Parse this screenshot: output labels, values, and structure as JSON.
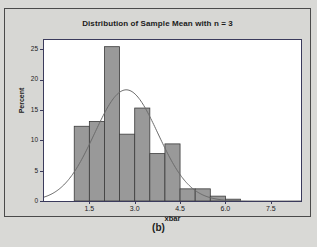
{
  "figure": {
    "caption": "(b)",
    "background_color": "#d9d9d6",
    "panel_border_color": "#4a4a4a"
  },
  "chart_data": {
    "type": "bar",
    "subtype": "histogram-with-normal-curve",
    "title": "Distribution of Sample Mean with n = 3",
    "xlabel": "xbar",
    "ylabel": "Percent",
    "xlim": [
      0.0,
      8.5
    ],
    "ylim": [
      0,
      26.5
    ],
    "grid": false,
    "legend": null,
    "bar_color": "#999999",
    "bar_edge_color": "#3b3b3b",
    "curve_color": "#6b6b6b",
    "axis_color": "#3b3b5c",
    "bin_width": 0.5,
    "xticks": [
      1.5,
      3.0,
      4.5,
      6.0,
      7.5
    ],
    "xtick_labels": [
      "1.5",
      "3.0",
      "4.5",
      "6.0",
      "7.5"
    ],
    "yticks": [
      0,
      5,
      10,
      15,
      20,
      25
    ],
    "ytick_labels": [
      "0",
      "5",
      "10",
      "15",
      "20",
      "25"
    ],
    "bins": [
      {
        "left": 1.0,
        "right": 1.5,
        "center": 1.25,
        "value": 12.3
      },
      {
        "left": 1.5,
        "right": 2.0,
        "center": 1.75,
        "value": 13.1
      },
      {
        "left": 2.0,
        "right": 2.5,
        "center": 2.25,
        "value": 25.4
      },
      {
        "left": 2.5,
        "right": 3.0,
        "center": 2.75,
        "value": 11.0
      },
      {
        "left": 3.0,
        "right": 3.5,
        "center": 3.25,
        "value": 15.3
      },
      {
        "left": 3.5,
        "right": 4.0,
        "center": 3.75,
        "value": 7.8
      },
      {
        "left": 4.0,
        "right": 4.5,
        "center": 4.25,
        "value": 9.4
      },
      {
        "left": 4.5,
        "right": 5.0,
        "center": 4.75,
        "value": 2.0
      },
      {
        "left": 5.0,
        "right": 5.5,
        "center": 5.25,
        "value": 2.0
      },
      {
        "left": 5.5,
        "right": 6.0,
        "center": 5.75,
        "value": 0.8
      },
      {
        "left": 6.0,
        "right": 6.5,
        "center": 6.25,
        "value": 0.3
      }
    ],
    "categories": [
      "1.25",
      "1.75",
      "2.25",
      "2.75",
      "3.25",
      "3.75",
      "4.25",
      "4.75",
      "5.25",
      "5.75",
      "6.25"
    ],
    "values": [
      12.3,
      13.1,
      25.4,
      11.0,
      15.3,
      7.8,
      9.4,
      2.0,
      2.0,
      0.8,
      0.3
    ],
    "normal_curve": {
      "mean": 2.72,
      "sigma": 1.05,
      "peak_value": 18.3,
      "description": "fitted normal density overlay scaled to percent"
    }
  }
}
